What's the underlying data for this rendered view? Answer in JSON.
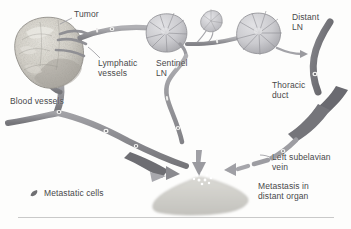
{
  "figure": {
    "type": "biomedical-diagram",
    "background_color": "#fdfdfc",
    "ink_color": "#48484a"
  },
  "labels": {
    "tumor": "Tumor",
    "lymphatic_vessels": "Lymphatic\nvessels",
    "sentinel_ln": "Sentinel\nLN",
    "distant_ln": "Distant\nLN",
    "thoracic_duct": "Thoracic\nduct",
    "blood_vessels": "Blood vessels",
    "left_subclavian_vein": "Left subelavian\nvein",
    "metastasis_distant_organ": "Metastasis in\ndistant organ"
  },
  "legend": {
    "items": [
      {
        "label": "Metastatic cells",
        "swatch": "metastatic-cell-glyph",
        "color": "#6f6f72"
      }
    ]
  },
  "structures": {
    "primary_tumor": {
      "name": "primary-tumor-mass",
      "fill": "#d8d6d0"
    },
    "sentinel_lymph_node": {
      "name": "sentinel-lymph-node",
      "fill": "#cfcfd2"
    },
    "small_lymph_node": {
      "name": "small-lymph-node",
      "fill": "#d5d5d8"
    },
    "distant_lymph_node": {
      "name": "distant-lymph-node",
      "fill": "#cfcfd2"
    },
    "thoracic_duct_vessel": {
      "name": "thoracic-duct-vessel",
      "fill": "#6e6e72"
    },
    "lymphatic_vessel_network": {
      "name": "lymphatic-vessel-network",
      "fill": "#9a9a9e"
    },
    "blood_vessel_network": {
      "name": "blood-vessel-network",
      "fill": "#8c8c90"
    },
    "distant_organ": {
      "name": "distant-organ",
      "fill": "#cfcfcb"
    },
    "metastatic_cell_cluster": {
      "name": "metastatic-cell-cluster",
      "fill": "#ffffff"
    }
  }
}
